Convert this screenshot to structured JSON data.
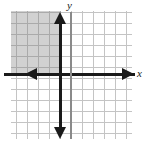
{
  "figure": {
    "name": "coordinate-plane-inequality-graph",
    "width": 147,
    "height": 146,
    "background_color": "#ffffff"
  },
  "labels": {
    "x_axis": "x",
    "y_axis": "y"
  },
  "colors": {
    "grid": "#c4c4c4",
    "axis": "#1a1a1a",
    "y_axis": "#8a8a8a",
    "boundary_line": "#1a1a1a",
    "shading": "#787878"
  },
  "chart_data": {
    "type": "scatter",
    "title": "",
    "xlabel": "x",
    "ylabel": "y",
    "grid": true,
    "legend": "none",
    "xlim": [
      -6,
      5
    ],
    "ylim": [
      -6,
      6
    ],
    "x_tick_step": 1,
    "y_tick_step": 1,
    "tick_labels_shown": false,
    "axes": [
      {
        "name": "x-axis",
        "orientation": "horizontal",
        "position": 0,
        "style": "thick-solid",
        "arrows": [
          "left",
          "right"
        ]
      },
      {
        "name": "y-axis",
        "orientation": "vertical",
        "position": 0,
        "style": "thin-solid",
        "arrows": []
      }
    ],
    "boundary_lines": [
      {
        "name": "vertical-boundary",
        "equation": "x = -1",
        "orientation": "vertical",
        "x_intercept": -1,
        "style": "solid",
        "thickness": "thick",
        "arrows": [
          "up",
          "down"
        ]
      }
    ],
    "shaded_regions": [
      {
        "name": "solution-region",
        "description": "Region left of x = -1 and above y = 0 (quadrant II)",
        "conditions": [
          "x <= -1",
          "y >= 0"
        ],
        "x_range": [
          -6,
          -1
        ],
        "y_range": [
          0,
          6
        ],
        "fill": "#787878",
        "opacity": 0.34
      }
    ],
    "series": [],
    "annotations": []
  }
}
